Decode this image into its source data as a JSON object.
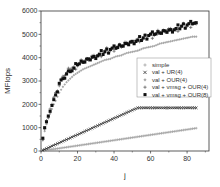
{
  "chart_data": {
    "type": "scatter",
    "title": "",
    "xlabel": "j",
    "ylabel": "MFlops",
    "xlim": [
      0,
      92
    ],
    "ylim": [
      0,
      6000
    ],
    "xticks": [
      0,
      20,
      40,
      60,
      80
    ],
    "yticks": [
      0,
      1000,
      2000,
      3000,
      4000,
      5000,
      6000
    ],
    "grid": false,
    "legend_position": "center-right (inside plot)",
    "x": [
      1,
      2,
      3,
      4,
      5,
      6,
      7,
      8,
      10,
      12,
      14,
      16,
      18,
      20,
      23,
      26,
      29,
      32,
      35,
      38,
      41,
      44,
      47,
      50,
      53,
      56,
      59,
      62,
      65,
      68,
      71,
      74,
      77,
      80,
      83,
      85
    ],
    "series": [
      {
        "name": "simple",
        "marker": "plus",
        "color": "#9a9a9a",
        "dense": true,
        "values": [
          12,
          23,
          35,
          46,
          58,
          69,
          81,
          92,
          115,
          138,
          161,
          184,
          207,
          230,
          265,
          299,
          334,
          368,
          403,
          437,
          472,
          506,
          541,
          575,
          610,
          644,
          679,
          713,
          748,
          782,
          817,
          851,
          886,
          920,
          955,
          978
        ]
      },
      {
        "name": "val + UR(4)",
        "marker": "cross",
        "color": "#1a1a1a",
        "dense": true,
        "values": [
          35,
          70,
          105,
          140,
          175,
          210,
          245,
          280,
          350,
          420,
          490,
          560,
          630,
          700,
          805,
          910,
          1015,
          1120,
          1225,
          1330,
          1435,
          1540,
          1645,
          1750,
          1850,
          1850,
          1850,
          1850,
          1850,
          1850,
          1850,
          1850,
          1850,
          1850,
          1850,
          1850
        ]
      },
      {
        "name": "val + OUR(4)",
        "marker": "diamond",
        "color": "#a8a8a8",
        "dense": true,
        "values": [
          450,
          850,
          1150,
          1400,
          1600,
          1800,
          2000,
          2150,
          2500,
          2750,
          2950,
          3100,
          3250,
          3350,
          3500,
          3600,
          3700,
          3800,
          3900,
          3950,
          4050,
          4100,
          4200,
          4250,
          4300,
          4400,
          4450,
          4500,
          4600,
          4650,
          4700,
          4750,
          4800,
          4850,
          4900,
          4900
        ]
      },
      {
        "name": "val + vmsg + OUR(4)",
        "marker": "plus",
        "color": "#555555",
        "dense": false,
        "values": [
          500,
          950,
          1300,
          1450,
          1800,
          2000,
          2300,
          2500,
          2800,
          3200,
          3350,
          3500,
          3600,
          3650,
          3850,
          3900,
          4100,
          4100,
          4300,
          4300,
          4450,
          4450,
          4650,
          4650,
          4800,
          4800,
          4950,
          4950,
          5100,
          5100,
          5250,
          5200,
          5350,
          5350,
          5450,
          5450
        ]
      },
      {
        "name": "val + vmsg + OUR(8)",
        "marker": "square",
        "color": "#111111",
        "dense": false,
        "values": [
          550,
          1000,
          1250,
          1500,
          1700,
          1950,
          2200,
          2400,
          2900,
          3100,
          3300,
          3400,
          3550,
          3700,
          3800,
          3950,
          4050,
          4150,
          4250,
          4350,
          4400,
          4500,
          4600,
          4700,
          4750,
          4850,
          4950,
          5000,
          5050,
          5150,
          5200,
          5250,
          5350,
          5400,
          5450,
          5500
        ]
      }
    ]
  }
}
